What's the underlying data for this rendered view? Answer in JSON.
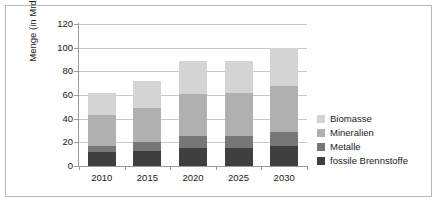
{
  "chart_data": {
    "type": "bar",
    "stacked": true,
    "title": "",
    "xlabel": "",
    "ylabel": "Menge (in Mrd. t)",
    "categories": [
      "2010",
      "2015",
      "2020",
      "2025",
      "2030"
    ],
    "ylim": [
      0,
      120
    ],
    "yticks": [
      0,
      20,
      40,
      60,
      80,
      100,
      120
    ],
    "ytick_labels": [
      "0",
      "20",
      "40",
      "60",
      "80",
      "100",
      "120"
    ],
    "grid": true,
    "legend_position": "right",
    "series": [
      {
        "name": "fossile Brennstoffe",
        "color": "#3f3f3f",
        "values": [
          12,
          13,
          15,
          15,
          17
        ]
      },
      {
        "name": "Metalle",
        "color": "#777777",
        "values": [
          5,
          7,
          10,
          10,
          12
        ]
      },
      {
        "name": "Mineralien",
        "color": "#b0b0b0",
        "values": [
          26,
          29,
          36,
          37,
          39
        ]
      },
      {
        "name": "Biomasse",
        "color": "#d4d4d4",
        "values": [
          19,
          23,
          28,
          27,
          32
        ]
      }
    ],
    "series_totals": [
      62,
      72,
      89,
      89,
      100
    ],
    "legend_entries": [
      {
        "label": "Biomasse",
        "color": "#d4d4d4"
      },
      {
        "label": "Mineralien",
        "color": "#b0b0b0"
      },
      {
        "label": "Metalle",
        "color": "#777777"
      },
      {
        "label": "fossile Brennstoffe",
        "color": "#3f3f3f"
      }
    ]
  },
  "axis": {
    "y_title": "Menge (in Mrd. t)"
  },
  "colors": {
    "frame": "#b8b8b8",
    "axis": "#9a9a9a",
    "grid": "#c9c9c9",
    "text": "#1a1a1a",
    "background": "#ffffff"
  }
}
